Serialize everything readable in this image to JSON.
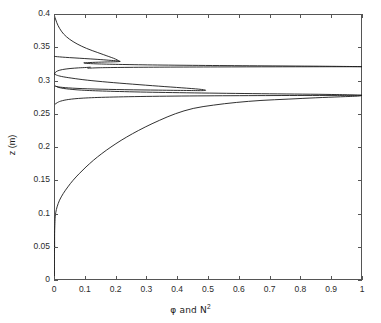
{
  "figure": {
    "background": "#ffffff",
    "line_color": "#1a1a1a",
    "axis_color": "#555555"
  },
  "axes": {
    "x_title_prefix": "φ and N",
    "x_title_sup": "2",
    "x_title_full": "φ and N2",
    "y_title": "z (m)",
    "x_ticks": [
      "0",
      "0.1",
      "0.2",
      "0.3",
      "0.4",
      "0.5",
      "0.6",
      "0.7",
      "0.8",
      "0.9",
      "1"
    ],
    "y_ticks": [
      "0",
      "0.05",
      "0.1",
      "0.15",
      "0.2",
      "0.25",
      "0.3",
      "0.35",
      "0.4"
    ]
  },
  "chart_data": {
    "type": "line",
    "title": "",
    "xlabel": "φ and N2",
    "ylabel": "z (m)",
    "xlim": [
      0,
      1
    ],
    "ylim": [
      0,
      0.4
    ],
    "xticks": [
      0,
      0.1,
      0.2,
      0.3,
      0.4,
      0.5,
      0.6,
      0.7,
      0.8,
      0.9,
      1
    ],
    "yticks": [
      0,
      0.05,
      0.1,
      0.15,
      0.2,
      0.25,
      0.3,
      0.35,
      0.4
    ],
    "grid": false,
    "legend": "none",
    "orientation": "x-is-value, y-is-depth",
    "series": [
      {
        "name": "phi-lower",
        "comment": "broad scalar profile rising from ~0 at z=0.05 to 1 near z=0.275",
        "points": [
          [
            0.002,
            0.05
          ],
          [
            0.002,
            0.07
          ],
          [
            0.003,
            0.085
          ],
          [
            0.004,
            0.095
          ],
          [
            0.006,
            0.102
          ],
          [
            0.01,
            0.11
          ],
          [
            0.018,
            0.12
          ],
          [
            0.03,
            0.13
          ],
          [
            0.045,
            0.14
          ],
          [
            0.062,
            0.15
          ],
          [
            0.082,
            0.16
          ],
          [
            0.104,
            0.17
          ],
          [
            0.128,
            0.18
          ],
          [
            0.155,
            0.19
          ],
          [
            0.185,
            0.2
          ],
          [
            0.218,
            0.21
          ],
          [
            0.255,
            0.22
          ],
          [
            0.296,
            0.23
          ],
          [
            0.342,
            0.24
          ],
          [
            0.394,
            0.25
          ],
          [
            0.452,
            0.258
          ],
          [
            0.518,
            0.263
          ],
          [
            0.592,
            0.267
          ],
          [
            0.672,
            0.27
          ],
          [
            0.76,
            0.272
          ],
          [
            0.85,
            0.274
          ],
          [
            0.93,
            0.2755
          ],
          [
            0.985,
            0.2765
          ],
          [
            1.0,
            0.2775
          ]
        ]
      },
      {
        "name": "N2-peak-lower",
        "comment": "sharp buoyancy-frequency spike centred at z=0.2775 reaching 1",
        "points": [
          [
            0.004,
            0.2645
          ],
          [
            0.01,
            0.2665
          ],
          [
            0.022,
            0.269
          ],
          [
            0.048,
            0.2715
          ],
          [
            0.095,
            0.2735
          ],
          [
            0.18,
            0.275
          ],
          [
            0.32,
            0.2762
          ],
          [
            0.52,
            0.277
          ],
          [
            0.74,
            0.2774
          ],
          [
            0.92,
            0.2776
          ],
          [
            1.0,
            0.2778
          ],
          [
            0.9,
            0.279
          ],
          [
            0.7,
            0.28
          ],
          [
            0.48,
            0.2812
          ],
          [
            0.3,
            0.2825
          ],
          [
            0.17,
            0.284
          ],
          [
            0.09,
            0.2855
          ],
          [
            0.04,
            0.2875
          ],
          [
            0.016,
            0.2895
          ],
          [
            0.006,
            0.2915
          ]
        ]
      },
      {
        "name": "phi-middle-lobe",
        "comment": "mid lobe bulging out to about 0.49 near z=0.285 then folding back",
        "points": [
          [
            0.004,
            0.2915
          ],
          [
            0.02,
            0.29
          ],
          [
            0.06,
            0.2885
          ],
          [
            0.13,
            0.2872
          ],
          [
            0.23,
            0.2862
          ],
          [
            0.34,
            0.2855
          ],
          [
            0.43,
            0.285
          ],
          [
            0.48,
            0.2848
          ],
          [
            0.492,
            0.2855
          ],
          [
            0.47,
            0.287
          ],
          [
            0.415,
            0.289
          ],
          [
            0.34,
            0.2915
          ],
          [
            0.255,
            0.2945
          ],
          [
            0.175,
            0.2975
          ],
          [
            0.108,
            0.3005
          ],
          [
            0.058,
            0.3035
          ],
          [
            0.025,
            0.306
          ],
          [
            0.008,
            0.3082
          ],
          [
            0.002,
            0.3098
          ]
        ]
      },
      {
        "name": "phi-small-loop",
        "comment": "small closed loop near z=0.30-0.315 on the left margin",
        "points": [
          [
            0.002,
            0.3098
          ],
          [
            0.004,
            0.312
          ],
          [
            0.012,
            0.3145
          ],
          [
            0.028,
            0.3165
          ],
          [
            0.052,
            0.318
          ],
          [
            0.08,
            0.319
          ],
          [
            0.105,
            0.3196
          ],
          [
            0.118,
            0.32
          ]
        ]
      },
      {
        "name": "N2-peak-upper",
        "comment": "second sharp spike centred at z=0.3205 reaching 1",
        "points": [
          [
            0.11,
            0.3185
          ],
          [
            0.15,
            0.3192
          ],
          [
            0.23,
            0.3197
          ],
          [
            0.36,
            0.3201
          ],
          [
            0.53,
            0.3204
          ],
          [
            0.72,
            0.3206
          ],
          [
            0.88,
            0.3207
          ],
          [
            1.0,
            0.3208
          ],
          [
            0.86,
            0.3215
          ],
          [
            0.66,
            0.3221
          ],
          [
            0.47,
            0.3227
          ],
          [
            0.32,
            0.3234
          ],
          [
            0.21,
            0.3242
          ],
          [
            0.14,
            0.325
          ],
          [
            0.105,
            0.3258
          ],
          [
            0.098,
            0.3265
          ]
        ]
      },
      {
        "name": "phi-upper-shoulder",
        "comment": "shoulder peaking near 0.215 at z=0.3270 before sweeping left",
        "points": [
          [
            0.098,
            0.3265
          ],
          [
            0.125,
            0.3272
          ],
          [
            0.165,
            0.3278
          ],
          [
            0.2,
            0.3282
          ],
          [
            0.215,
            0.3287
          ],
          [
            0.205,
            0.3295
          ],
          [
            0.178,
            0.3305
          ],
          [
            0.14,
            0.3318
          ],
          [
            0.1,
            0.333
          ],
          [
            0.065,
            0.334
          ],
          [
            0.038,
            0.3348
          ],
          [
            0.018,
            0.3355
          ],
          [
            0.006,
            0.336
          ],
          [
            0.002,
            0.3363
          ]
        ]
      },
      {
        "name": "phi-top-tail",
        "comment": "upper decaying branch from the 0.215 shoulder up to the top-left corner at z=0.4",
        "points": [
          [
            0.212,
            0.329
          ],
          [
            0.205,
            0.331
          ],
          [
            0.193,
            0.3335
          ],
          [
            0.178,
            0.336
          ],
          [
            0.16,
            0.339
          ],
          [
            0.142,
            0.342
          ],
          [
            0.124,
            0.345
          ],
          [
            0.106,
            0.3482
          ],
          [
            0.09,
            0.3515
          ],
          [
            0.075,
            0.355
          ],
          [
            0.062,
            0.3585
          ],
          [
            0.05,
            0.3622
          ],
          [
            0.04,
            0.366
          ],
          [
            0.031,
            0.37
          ],
          [
            0.024,
            0.3742
          ],
          [
            0.018,
            0.3785
          ],
          [
            0.013,
            0.3828
          ],
          [
            0.009,
            0.387
          ],
          [
            0.006,
            0.391
          ],
          [
            0.003,
            0.395
          ],
          [
            0.001,
            0.3985
          ],
          [
            0.0,
            0.4
          ]
        ]
      },
      {
        "name": "phi-left-baseline",
        "comment": "near-zero baseline hugging the left axis from z=0 up to z=0.05",
        "points": [
          [
            0.001,
            0.0
          ],
          [
            0.001,
            0.02
          ],
          [
            0.001,
            0.04
          ],
          [
            0.002,
            0.05
          ]
        ]
      }
    ]
  }
}
